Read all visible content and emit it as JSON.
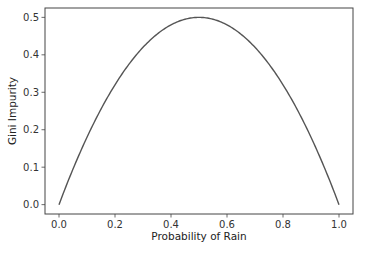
{
  "chart_data": {
    "type": "line",
    "title": "",
    "xlabel": "Probability of Rain",
    "ylabel": "Gini Impurity",
    "xlim": [
      -0.05,
      1.05
    ],
    "ylim": [
      -0.025,
      0.525
    ],
    "xticks": [
      "0.0",
      "0.2",
      "0.4",
      "0.6",
      "0.8",
      "1.0"
    ],
    "yticks": [
      "0.0",
      "0.1",
      "0.2",
      "0.3",
      "0.4",
      "0.5"
    ],
    "grid": false,
    "legend": null,
    "series": [
      {
        "name": "Gini Impurity",
        "color": "#555555",
        "function": "2*p*(1-p)",
        "x": [
          0.0,
          0.1,
          0.2,
          0.3,
          0.4,
          0.5,
          0.6,
          0.7,
          0.8,
          0.9,
          1.0
        ],
        "y": [
          0.0,
          0.18,
          0.32,
          0.42,
          0.48,
          0.5,
          0.48,
          0.42,
          0.32,
          0.18,
          0.0
        ]
      }
    ]
  }
}
